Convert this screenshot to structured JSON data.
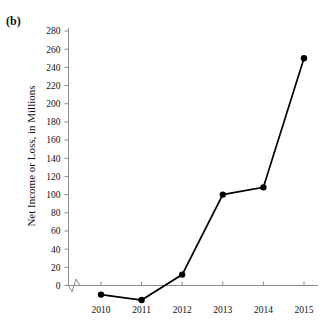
{
  "figure": {
    "panel_label": "(b)",
    "cropped_header_text": "",
    "background": "#ffffff",
    "line_color": "#000000",
    "axis_color": "#8c8c8c"
  },
  "chart_data": {
    "type": "line",
    "title": "",
    "xlabel": "",
    "ylabel": "Net Income or Loss, in Millions",
    "categories": [
      "2010",
      "2011",
      "2012",
      "2013",
      "2014",
      "2015"
    ],
    "x": [
      2010,
      2011,
      2012,
      2013,
      2014,
      2015
    ],
    "values": [
      -10,
      -16,
      12,
      100,
      108,
      250
    ],
    "series": [
      {
        "name": "Net Income or Loss",
        "values": [
          -10,
          -16,
          12,
          100,
          108,
          250
        ]
      }
    ],
    "ylim": [
      0,
      280
    ],
    "ytick_step": 20,
    "yticks": [
      0,
      20,
      40,
      60,
      80,
      100,
      120,
      140,
      160,
      180,
      200,
      220,
      240,
      260,
      280
    ],
    "ytick_labels": [
      "0",
      "20",
      "40",
      "60",
      "80",
      "100",
      "120",
      "140",
      "160",
      "180",
      "200",
      "220",
      "240",
      "260",
      "280"
    ],
    "xtick_labels": [
      "2010",
      "2011",
      "2012",
      "2013",
      "2014",
      "2015"
    ],
    "grid": false,
    "legend": false,
    "legend_position": "none",
    "marker": "filled-circle",
    "axis_break": true,
    "annotations": []
  }
}
